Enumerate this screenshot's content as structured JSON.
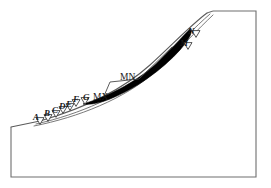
{
  "figure": {
    "type": "slope-cross-section-diagram",
    "background_color": "#ffffff",
    "outline_color": "#6e6e6e",
    "curve_color": "#555555",
    "band_color": "#000000",
    "label_color": "#1a1a1a",
    "marker_fill": "#ffffff",
    "marker_stroke": "#2a2a2a"
  },
  "markers": {
    "lower_slope": [
      {
        "id": "A",
        "label": "A",
        "x": 40,
        "y": 121,
        "label_x": 33,
        "label_y": 113
      },
      {
        "id": "B",
        "label": "B",
        "x": 48,
        "y": 118,
        "label_x": 44,
        "label_y": 109
      },
      {
        "id": "C",
        "label": "C",
        "x": 56,
        "y": 114,
        "label_x": 52,
        "label_y": 106
      },
      {
        "id": "D",
        "label": "D",
        "x": 63,
        "y": 110,
        "label_x": 59,
        "label_y": 102
      },
      {
        "id": "E",
        "label": "E",
        "x": 70,
        "y": 107,
        "label_x": 66,
        "label_y": 100
      },
      {
        "id": "F",
        "label": "F",
        "x": 76,
        "y": 103,
        "label_x": 73,
        "label_y": 95
      },
      {
        "id": "G",
        "label": "G",
        "x": 85,
        "y": 101,
        "label_x": 83,
        "label_y": 93
      }
    ],
    "upper_slope": [
      {
        "id": "M",
        "label": "M",
        "x": 188,
        "y": 46,
        "label_x": 180,
        "label_y": 39
      },
      {
        "id": "N",
        "label": "N",
        "x": 196,
        "y": 34,
        "label_x": 188,
        "label_y": 27
      }
    ]
  },
  "callouts": [
    {
      "id": "MN",
      "label": "MN",
      "label_x": 120,
      "label_y": 73,
      "leader": "M 104 96 L 110 82 L 139 79 L 172 47"
    },
    {
      "id": "MX",
      "label": "MX",
      "label_x": 93,
      "label_y": 93,
      "leader": ""
    }
  ],
  "geometry": {
    "outer_border": "M 11 127 L 11 177 L 256 177 L 256 11 L 213 11",
    "crest_line": "M 213 11 L 207 13",
    "ground_surface": "M 11 127 L 40 121 C 78 110 120 92 150 65 C 172 45 192 24 207 13",
    "failure_surface_inner": "M 36 124 C 80 114 122 96 152 69 C 175 48 196 26 210 14",
    "failure_surface_outer": "M 34 126 C 79 117 124 99 155 72 C 178 51 199 28 213 15",
    "weak_layer_band": "M 83 104 C 110 96 140 80 160 60 C 175 45 185 34 190 29 C 193 32 190 38 180 50 C 162 70 135 89 110 99 C 100 103 90 105 83 104 Z"
  }
}
